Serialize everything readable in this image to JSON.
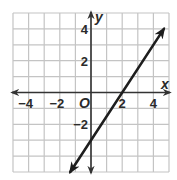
{
  "chart_data": {
    "type": "line",
    "title": "",
    "xlabel": "x",
    "ylabel": "y",
    "origin_label": "O",
    "xlim": [
      -5,
      5
    ],
    "ylim": [
      -5,
      5
    ],
    "grid": true,
    "grid_step": 1,
    "x_ticks": [
      -4,
      -2,
      2,
      4
    ],
    "y_ticks": [
      4,
      2,
      -2
    ],
    "x_tick_labels": [
      "−4",
      "−2",
      "2",
      "4"
    ],
    "y_tick_labels": [
      "4",
      "2",
      "−2"
    ],
    "series": [
      {
        "name": "line",
        "equation": "y = 1.5x - 3",
        "slope": 1.5,
        "intercept": -3,
        "x": [
          -1.33,
          4.67
        ],
        "y": [
          -5,
          4
        ],
        "arrows_both_ends": true
      }
    ],
    "colors": {
      "grid": "#c4c4c4",
      "axis": "#333333",
      "line": "#1e1e1e"
    }
  }
}
